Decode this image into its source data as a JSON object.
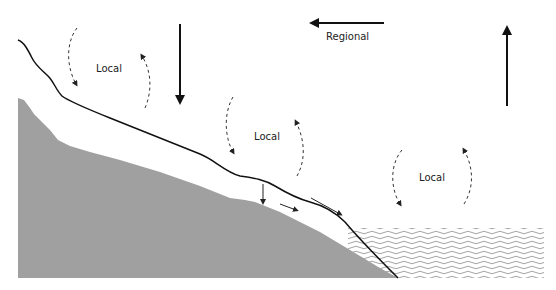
{
  "diagram": {
    "labels": {
      "local_left": "Local",
      "local_middle": "Local",
      "local_right": "Local",
      "regional": "Regional"
    },
    "colors": {
      "ground": "#a0a0a0",
      "surface_line": "#111111",
      "arrows": "#111111",
      "water_waves": "#8c8c8c",
      "background": "#ffffff"
    },
    "elements": [
      "ground-slope",
      "slope-surface-line",
      "water-body",
      "regional-arrow-left",
      "downward-arrow",
      "upward-arrow",
      "local-circulation-left",
      "local-circulation-middle",
      "local-circulation-right",
      "downslope-flow-arrows"
    ]
  }
}
